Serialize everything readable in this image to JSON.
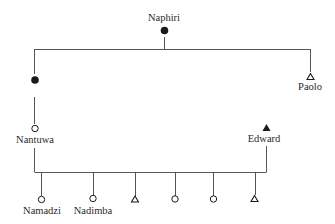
{
  "diagram": {
    "type": "kinship-chart",
    "colors": {
      "line": "#555555",
      "symbol": "#1a1a1a",
      "text": "#2a2a2a",
      "background": "#ffffff"
    },
    "people": {
      "naphiri": {
        "name": "Naphiri",
        "symbol": "filled-circle",
        "sex": "female",
        "deceased": true
      },
      "unnamed_daughter": {
        "name": "",
        "symbol": "filled-circle",
        "sex": "female",
        "deceased": true
      },
      "paolo": {
        "name": "Paolo",
        "symbol": "open-triangle",
        "sex": "male",
        "deceased": false
      },
      "nantuwa": {
        "name": "Nantuwa",
        "symbol": "open-circle",
        "sex": "female",
        "deceased": false
      },
      "edward": {
        "name": "Edward",
        "symbol": "filled-triangle",
        "sex": "male",
        "deceased": true
      }
    },
    "children": [
      {
        "name": "Namadzi",
        "symbol": "open-circle",
        "sex": "female"
      },
      {
        "name": "Nadimba",
        "symbol": "open-circle",
        "sex": "female"
      },
      {
        "name": "",
        "symbol": "open-triangle",
        "sex": "male"
      },
      {
        "name": "",
        "symbol": "open-circle",
        "sex": "female"
      },
      {
        "name": "",
        "symbol": "open-circle",
        "sex": "female"
      },
      {
        "name": "",
        "symbol": "open-triangle",
        "sex": "male"
      }
    ],
    "relations": [
      {
        "type": "descent",
        "parent": "Naphiri",
        "children": [
          "unnamed daughter",
          "Paolo"
        ]
      },
      {
        "type": "descent",
        "parent": "unnamed daughter",
        "children": [
          "Nantuwa"
        ]
      },
      {
        "type": "marriage",
        "partners": [
          "Nantuwa",
          "Edward"
        ]
      },
      {
        "type": "descent",
        "parents": [
          "Nantuwa",
          "Edward"
        ],
        "children": [
          "Namadzi",
          "Nadimba",
          "son",
          "daughter",
          "daughter",
          "son"
        ]
      }
    ]
  }
}
